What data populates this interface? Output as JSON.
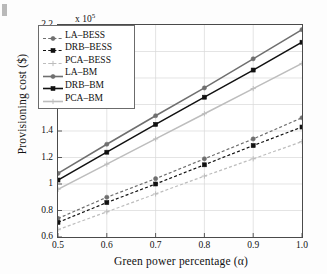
{
  "chart_data": {
    "type": "line",
    "title": "",
    "xlabel": "Green power percentage (α)",
    "ylabel": "Provisioning cost ($)",
    "y_exponent_label": "x 10",
    "y_exponent_value": "5",
    "x": [
      0.5,
      0.6,
      0.7,
      0.8,
      0.9,
      1.0
    ],
    "xlim": [
      0.5,
      1.0
    ],
    "ylim": [
      0.6,
      2.2
    ],
    "xticks": [
      "0.5",
      "0.6",
      "0.7",
      "0.8",
      "0.9",
      "1.0"
    ],
    "yticks": [
      "0.6",
      "0.8",
      "1",
      "1.2",
      "1.4",
      "1.6",
      "1.8",
      "2",
      "2.2"
    ],
    "grid": true,
    "legend_position": "upper-left",
    "series": [
      {
        "name": "LA-BESS",
        "style": "dashed",
        "marker": "circle",
        "color": "#6f6f6f",
        "values": [
          0.74,
          0.9,
          1.04,
          1.19,
          1.34,
          1.5
        ]
      },
      {
        "name": "DRB-BESS",
        "style": "dashed",
        "marker": "square",
        "color": "#111111",
        "values": [
          0.71,
          0.86,
          1.0,
          1.145,
          1.29,
          1.43
        ]
      },
      {
        "name": "PCA-BESS",
        "style": "dashed",
        "marker": "plus",
        "color": "#bdbdbd",
        "values": [
          0.655,
          0.79,
          0.925,
          1.06,
          1.19,
          1.32
        ]
      },
      {
        "name": "LA-BM",
        "style": "solid",
        "marker": "circle",
        "color": "#6f6f6f",
        "values": [
          1.08,
          1.3,
          1.515,
          1.725,
          1.945,
          2.165
        ]
      },
      {
        "name": "DRB-BM",
        "style": "solid",
        "marker": "square",
        "color": "#111111",
        "values": [
          1.03,
          1.24,
          1.45,
          1.655,
          1.86,
          2.07
        ]
      },
      {
        "name": "PCA-BM",
        "style": "solid",
        "marker": "plus",
        "color": "#bdbdbd",
        "values": [
          0.96,
          1.15,
          1.34,
          1.53,
          1.72,
          1.91
        ]
      }
    ]
  }
}
